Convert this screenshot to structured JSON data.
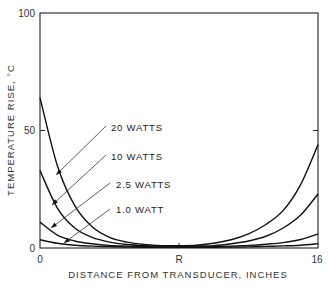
{
  "chart_data": {
    "type": "line",
    "title": "",
    "xlabel": "DISTANCE FROM TRANSDUCER, INCHES",
    "ylabel": "TEMPERATURE RISE, °C",
    "xlim": [
      0,
      16
    ],
    "ylim": [
      0,
      100
    ],
    "x_ticks": [
      {
        "value": 0,
        "label": "0"
      },
      {
        "value": 8,
        "label": "R"
      },
      {
        "value": 16,
        "label": "16"
      }
    ],
    "y_ticks": [
      {
        "value": 0,
        "label": "0"
      },
      {
        "value": 50,
        "label": "50"
      },
      {
        "value": 100,
        "label": "100"
      }
    ],
    "grid": false,
    "legend_position": "inline annotations with arrows",
    "x": [
      0,
      1,
      2,
      3,
      4,
      5,
      6,
      7,
      8,
      9,
      10,
      11,
      12,
      13,
      14,
      15,
      16
    ],
    "series": [
      {
        "name": "20 WATTS",
        "label_pos": [
          103,
          129
        ],
        "arrow_to": [
          4.3,
          57
        ],
        "values": [
          64,
          35,
          18,
          9,
          4.5,
          2.5,
          1.5,
          1,
          1,
          1.2,
          2,
          3.5,
          6,
          10,
          16,
          27,
          44
        ]
      },
      {
        "name": "10 WATTS",
        "label_pos": [
          103,
          156
        ],
        "arrow_to": [
          2.6,
          75
        ],
        "values": [
          33,
          17,
          8.5,
          4.5,
          2.5,
          1.5,
          1,
          0.8,
          0.7,
          0.8,
          1,
          1.8,
          3,
          5,
          8.5,
          14,
          23
        ]
      },
      {
        "name": "2.5 WATTS",
        "label_pos": [
          108,
          188
        ],
        "arrow_to": [
          2.0,
          92
        ],
        "values": [
          11,
          5.5,
          3,
          1.8,
          1.1,
          0.8,
          0.6,
          0.5,
          0.5,
          0.5,
          0.6,
          0.8,
          1.1,
          1.6,
          2.3,
          3.6,
          6
        ]
      },
      {
        "name": "1.0 WATT",
        "label_pos": [
          108,
          213
        ],
        "arrow_to": [
          3.2,
          99
        ],
        "values": [
          3.5,
          2,
          1.2,
          0.8,
          0.6,
          0.4,
          0.3,
          0.3,
          0.3,
          0.3,
          0.3,
          0.4,
          0.5,
          0.7,
          0.9,
          1.2,
          1.8
        ]
      }
    ]
  },
  "labels": {
    "y_title": "TEMPERATURE RISE, °C",
    "x_title": "DISTANCE FROM TRANSDUCER, INCHES",
    "y100": "100",
    "y50": "50",
    "y0": "0",
    "x0": "0",
    "xR": "R",
    "x16": "16",
    "s20": "20 WATTS",
    "s10": "10 WATTS",
    "s25": "2.5 WATTS",
    "s1": "1.0 WATT"
  }
}
